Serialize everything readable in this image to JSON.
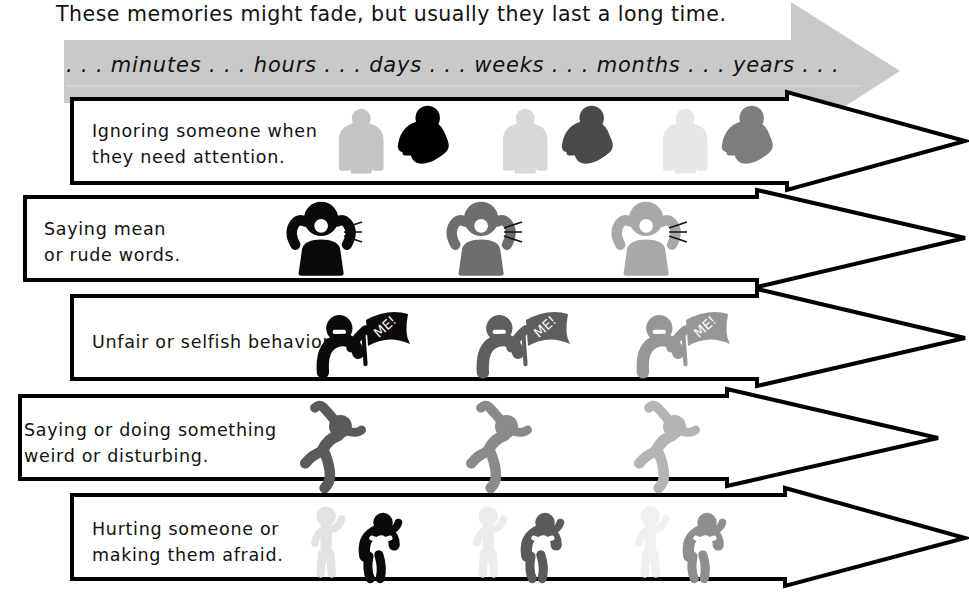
{
  "headline": "These memories might fade, but usually they last a long time.",
  "timeline": {
    "label": ". . . minutes . . . hours . . . days . . . weeks . . . months . . . years . . .",
    "units": [
      "minutes",
      "hours",
      "days",
      "weeks",
      "months",
      "years"
    ],
    "band_color": "#c9c9c9",
    "direction": "left-to-right"
  },
  "rows": [
    {
      "id": "ignoring",
      "line1": "Ignoring someone when",
      "line2": "they need attention.",
      "pictogram": "person-ignoring-person",
      "fade_shades": [
        "#000000",
        "#4a4a4a",
        "#7d7d7d"
      ],
      "bystander_shades": [
        "#c4c4c4",
        "#d8d8d8",
        "#e6e6e6"
      ],
      "repeats": 3
    },
    {
      "id": "mean-words",
      "line1": "Saying mean",
      "line2": "or rude words.",
      "pictogram": "person-shouting",
      "fade_shades": [
        "#0a0a0a",
        "#6e6e6e",
        "#a8a8a8"
      ],
      "repeats": 3
    },
    {
      "id": "unfair",
      "line1": "Unfair or selfish behavior.",
      "line2": "",
      "pictogram": "person-waving-me-flag",
      "flag_text": "ME!",
      "fade_shades": [
        "#0a0a0a",
        "#5e5e5e",
        "#969696"
      ],
      "repeats": 3
    },
    {
      "id": "weird",
      "line1": "Saying or doing something",
      "line2": "weird or disturbing.",
      "pictogram": "person-flailing",
      "fade_shades": [
        "#5a5a5a",
        "#8a8a8a",
        "#b4b4b4"
      ],
      "repeats": 3
    },
    {
      "id": "hurting",
      "line1": "Hurting someone or",
      "line2": "making them afraid.",
      "pictogram": "person-threatening-person-cowering",
      "fade_shades": [
        "#0a0a0a",
        "#5a5a5a",
        "#8e8e8e"
      ],
      "bystander_shades": [
        "#e2e2e2",
        "#ececec",
        "#f0f0f0"
      ],
      "repeats": 3
    }
  ],
  "colors": {
    "outline": "#000000",
    "background": "#ffffff",
    "timeline_grey": "#c9c9c9"
  }
}
